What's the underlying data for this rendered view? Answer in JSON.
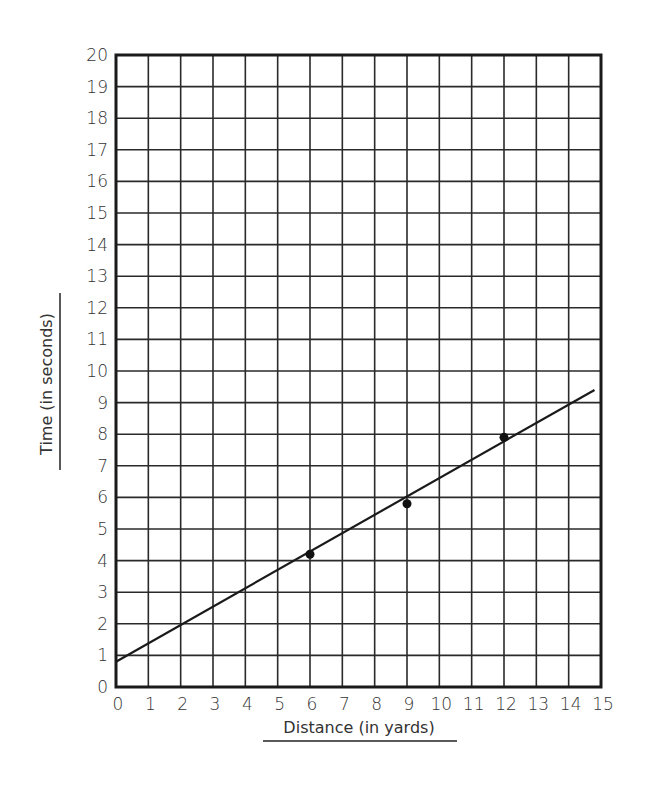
{
  "chart_data": {
    "type": "scatter",
    "title": "",
    "xlabel": "Distance (in yards)",
    "ylabel": "Time (in seconds)",
    "xlim": [
      0,
      15
    ],
    "ylim": [
      0,
      20
    ],
    "grid": true,
    "x_ticks": [
      0,
      1,
      2,
      3,
      4,
      5,
      6,
      7,
      8,
      9,
      10,
      11,
      12,
      13,
      14,
      15
    ],
    "y_ticks": [
      0,
      1,
      2,
      3,
      4,
      5,
      6,
      7,
      8,
      9,
      10,
      11,
      12,
      13,
      14,
      15,
      16,
      17,
      18,
      19,
      20
    ],
    "series": [
      {
        "name": "Data points",
        "type": "scatter",
        "points": [
          {
            "x": 6,
            "y": 4.2
          },
          {
            "x": 9,
            "y": 5.8
          },
          {
            "x": 12,
            "y": 7.9
          }
        ]
      },
      {
        "name": "Line of best fit",
        "type": "line",
        "points": [
          {
            "x": 0,
            "y": 0.8
          },
          {
            "x": 14.8,
            "y": 9.4
          }
        ]
      }
    ],
    "colors": {
      "line": "#1a1a1a",
      "grid": "#2a2a2a",
      "points": "#111111"
    }
  }
}
